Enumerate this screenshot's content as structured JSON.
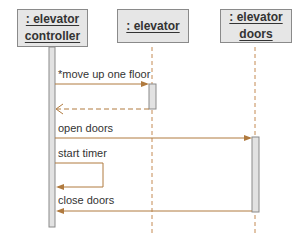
{
  "colors": {
    "arrow": "#b07a3e",
    "lifeline_dash": "#c48a52",
    "box_fill": "#e6e6e6",
    "box_border": "#8a8a8a",
    "activation_fill": "#e2e2e2",
    "text": "#333333"
  },
  "lifelines": [
    {
      "id": "controller",
      "line1": ": elevator",
      "line2": "controller"
    },
    {
      "id": "elevator",
      "line1": ": elevator"
    },
    {
      "id": "doors",
      "line1": ": elevator",
      "line2": "doors"
    }
  ],
  "messages": [
    {
      "label": "*move up one floor",
      "from": "elevator controller",
      "to": "elevator",
      "type": "synchronous"
    },
    {
      "label": "",
      "from": "elevator",
      "to": "elevator controller",
      "type": "return"
    },
    {
      "label": "open doors",
      "from": "elevator controller",
      "to": "elevator doors",
      "type": "synchronous"
    },
    {
      "label": "start timer",
      "from": "elevator controller",
      "to": "elevator controller",
      "type": "self"
    },
    {
      "label": "close doors",
      "from": "elevator doors",
      "to": "elevator controller",
      "type": "synchronous"
    }
  ]
}
